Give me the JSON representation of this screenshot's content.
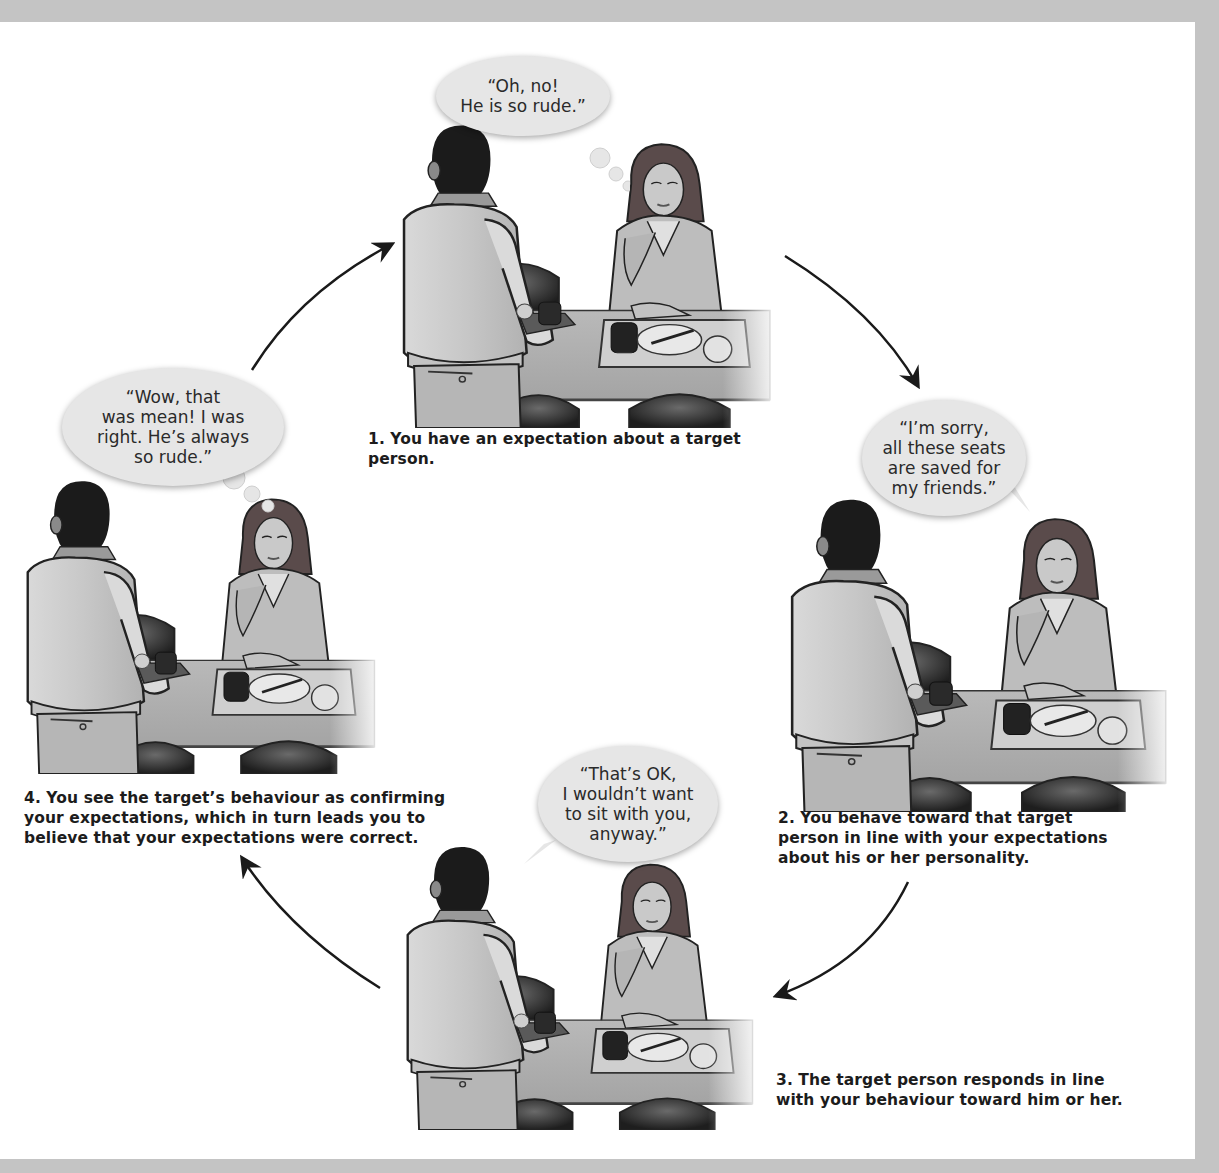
{
  "figure": {
    "colors": {
      "frame": "#c4c4c4",
      "background": "#ffffff",
      "caption_text": "#1c1c1c",
      "bubble_fill": "#e6e6e6",
      "arrow": "#1a1a1a"
    },
    "steps": [
      {
        "number": "1",
        "caption": "1. You have an expectation about a target person.",
        "bubble_type": "thought",
        "bubble_text": "“Oh, no!\nHe is so rude.”",
        "speaker": "you"
      },
      {
        "number": "2",
        "caption": "2. You behave toward that target person in line with your expectations about his or her personality.",
        "bubble_type": "speech",
        "bubble_text": "“I’m sorry,\nall these seats\nare saved for\nmy friends.”",
        "speaker": "you"
      },
      {
        "number": "3",
        "caption": "3. The target person responds in line with your behaviour toward him or her.",
        "bubble_type": "speech",
        "bubble_text": "“That’s OK,\nI wouldn’t want\nto sit with you,\nanyway.”",
        "speaker": "target"
      },
      {
        "number": "4",
        "caption": "4. You see the target’s behaviour as confirming your expectations, which in turn leads you to believe that your expectations were correct.",
        "bubble_type": "thought",
        "bubble_text": "“Wow, that\nwas mean! I was\nright. He’s always\nso rude.”",
        "speaker": "you"
      }
    ],
    "arrows": [
      {
        "from": "4",
        "to": "1",
        "direction": "up-right"
      },
      {
        "from": "1",
        "to": "2",
        "direction": "down-right"
      },
      {
        "from": "2",
        "to": "3",
        "direction": "down-left"
      },
      {
        "from": "3",
        "to": "4",
        "direction": "up-left"
      }
    ],
    "icons": {
      "scene": "cafeteria-scene-icon",
      "arrow": "curved-arrow-icon"
    }
  }
}
